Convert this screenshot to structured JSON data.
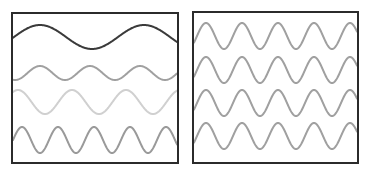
{
  "panels": [
    {
      "id": "left",
      "box": {
        "x": 12,
        "y": 13,
        "width": 166,
        "height": 150,
        "stroke": "#2b2b2b",
        "stroke_width": 2
      },
      "waves": [
        {
          "name": "wave-low-frequency",
          "center_y": 37,
          "amplitude": 12,
          "period": 104,
          "phase_x": 40,
          "color": "#3a3a3a",
          "stroke_width": 2
        },
        {
          "name": "wave-small-amplitude",
          "center_y": 73,
          "amplitude": 7,
          "period": 50,
          "phase_x": 40,
          "color": "#a0a0a0",
          "stroke_width": 2
        },
        {
          "name": "wave-medium",
          "center_y": 102,
          "amplitude": 12,
          "period": 54,
          "phase_x": 18,
          "color": "#d0d0d0",
          "stroke_width": 2
        },
        {
          "name": "wave-high-frequency",
          "center_y": 140,
          "amplitude": 13,
          "period": 36,
          "phase_x": 22,
          "color": "#9a9a9a",
          "stroke_width": 2
        }
      ]
    },
    {
      "id": "right",
      "box": {
        "x": 193,
        "y": 12,
        "width": 165,
        "height": 151,
        "stroke": "#2b2b2b",
        "stroke_width": 2
      },
      "waves": [
        {
          "name": "wave-row-1",
          "center_y": 36,
          "amplitude": 13,
          "period": 36,
          "phase_x": 206,
          "color": "#a0a0a0",
          "stroke_width": 2
        },
        {
          "name": "wave-row-2",
          "center_y": 70,
          "amplitude": 13,
          "period": 36,
          "phase_x": 206,
          "color": "#a0a0a0",
          "stroke_width": 2
        },
        {
          "name": "wave-row-3",
          "center_y": 103,
          "amplitude": 13,
          "period": 36,
          "phase_x": 206,
          "color": "#a0a0a0",
          "stroke_width": 2
        },
        {
          "name": "wave-row-4",
          "center_y": 136,
          "amplitude": 13,
          "period": 36,
          "phase_x": 206,
          "color": "#a0a0a0",
          "stroke_width": 2
        }
      ]
    }
  ]
}
